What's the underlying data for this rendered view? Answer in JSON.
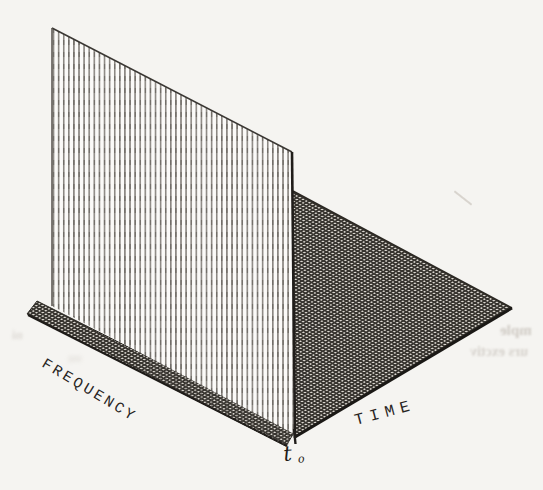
{
  "figure": {
    "labels": {
      "frequency_axis": "FREQUENCY",
      "time_axis": "TIME",
      "impulse_time_main": "t",
      "impulse_time_sub": "o"
    },
    "colors": {
      "paper": "#f5f4f1",
      "edge_ink": "#201d1a",
      "wall_hatch_line": "#827e78",
      "mesh_ink": "#37342f"
    },
    "bleedthrough_fragments": {
      "line1": "mple",
      "line2": "urs exctiv",
      "left_smudge": "ni",
      "mid_smudge": "ou"
    }
  }
}
